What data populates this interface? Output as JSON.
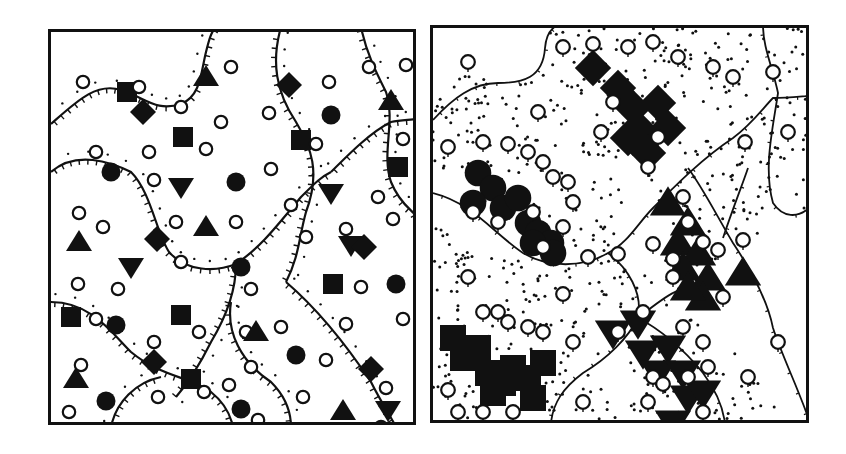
{
  "figure": {
    "panels": [
      {
        "id": "left",
        "description": "Mixed distribution: filled symbols (squares, diamonds, triangles, inverted triangles, circles) interspersed with open circles, with territory boundaries drawn as hatched (tick-marked) curves with dotted inner edges",
        "boundary_style": "hatched-curve-with-dots"
      },
      {
        "id": "right",
        "description": "Clustered distribution: same-type filled symbols aggregated into clumps (circles, diamonds, triangles, squares, inverted triangles) surrounded by open circles, regions separated by thin lines with stippled (dotted) areas",
        "boundary_style": "thin-line-with-stipple"
      }
    ],
    "symbol_types": [
      "open-circle",
      "filled-square",
      "filled-diamond",
      "filled-triangle",
      "filled-inverted-triangle",
      "filled-circle"
    ],
    "colors": {
      "ink": "#111111",
      "paper": "#ffffff"
    }
  }
}
